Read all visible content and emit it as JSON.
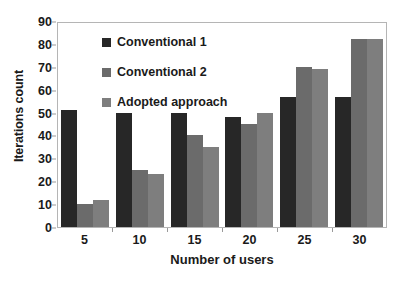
{
  "chart_data": {
    "type": "bar",
    "title": "",
    "xlabel": "Number of users",
    "ylabel": "Iterations count",
    "categories": [
      "5",
      "10",
      "15",
      "20",
      "25",
      "30"
    ],
    "yticks": [
      0,
      10,
      20,
      30,
      40,
      50,
      60,
      70,
      80,
      90
    ],
    "ylim": [
      0,
      90
    ],
    "grid": false,
    "legend_position": "upper-left-inside",
    "series": [
      {
        "name": "Conventional 1",
        "color": "#272727",
        "values": [
          51,
          50,
          50,
          48,
          57,
          57
        ]
      },
      {
        "name": "Conventional 2",
        "color": "#6b6b6b",
        "values": [
          10,
          25,
          40,
          45,
          70,
          82
        ]
      },
      {
        "name": "Adopted approach",
        "color": "#7e7e7e",
        "values": [
          12,
          23,
          35,
          50,
          69,
          82
        ]
      }
    ]
  }
}
